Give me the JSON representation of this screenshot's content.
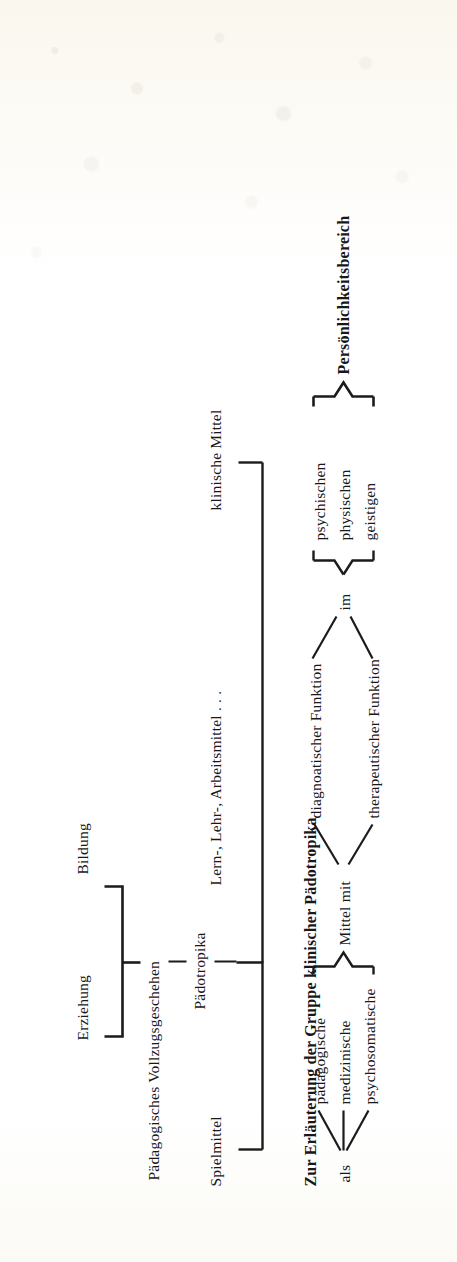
{
  "document": {
    "kind": "scanned-book-figure",
    "orientation": "rotated-90-ccw",
    "ink_color": "#1b1a1d",
    "paper_color": "#fdfcf7"
  },
  "diagram": {
    "pedagogy_tree": {
      "branch_top": "Erziehung",
      "branch_bottom": "Bildung",
      "trunk": "Pädagogisches Vollzugsgeschehen",
      "leaf": "Pädotropika"
    },
    "means_group": {
      "items": [
        "Spielmittel",
        "Lern-, Lehr-, Arbeitsmittel . . .",
        "klinische Mittel"
      ]
    },
    "caption": "Zur Erläuterung der Gruppe klinischer Pädotropika",
    "clinical_breakdown": {
      "connector_kind": "als",
      "kinds": [
        "pädagogische",
        "medizinische",
        "psychosomatische"
      ],
      "head": "Mittel mit",
      "functions": [
        "diagnoatischer Funktion",
        "therapeutischer Funktion"
      ],
      "connector_domain": "im",
      "domains": [
        "psychischen",
        "physischen",
        "geistigen"
      ],
      "domain_head": "Persönlichkeitsbereich"
    }
  }
}
